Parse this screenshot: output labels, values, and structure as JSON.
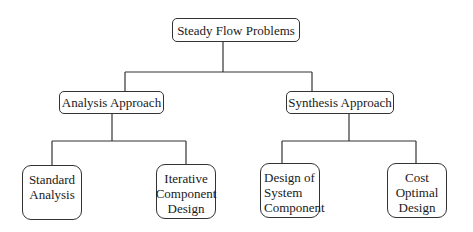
{
  "diagram": {
    "type": "hierarchy-tree",
    "root": {
      "id": "steady-flow-problems",
      "label": "Steady Flow Problems"
    },
    "level2": [
      {
        "id": "analysis-approach",
        "label": "Analysis Approach",
        "parent": "steady-flow-problems"
      },
      {
        "id": "synthesis-approach",
        "label": "Synthesis Approach",
        "parent": "steady-flow-problems"
      }
    ],
    "level3": [
      {
        "id": "standard-analysis",
        "lines": [
          "Standard",
          "Analysis"
        ],
        "parent": "analysis-approach"
      },
      {
        "id": "iterative-component-design",
        "lines": [
          "Iterative",
          "Component",
          "Design"
        ],
        "parent": "analysis-approach"
      },
      {
        "id": "design-of-system-component",
        "lines": [
          "Design of",
          "System",
          "Component"
        ],
        "parent": "synthesis-approach"
      },
      {
        "id": "cost-optimal-design",
        "lines": [
          "Cost",
          "Optimal",
          "Design"
        ],
        "parent": "synthesis-approach"
      }
    ],
    "colors": {
      "line": "#333333",
      "text": "#1a1a1a",
      "background": "#ffffff"
    }
  }
}
